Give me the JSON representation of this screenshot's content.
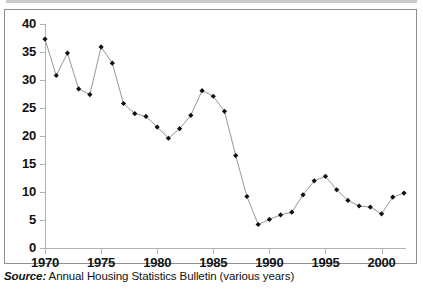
{
  "figure": {
    "caption_label": "Source:",
    "caption_text": "Annual Housing Statistics Bulletin (various years)",
    "frame_color": "#8e8e8e",
    "axis_color": "#b3b3b3",
    "marker_color": "#111111",
    "line_color": "#8a8a8a"
  },
  "chart_data": {
    "type": "line",
    "title": "",
    "subtitle": "",
    "xlabel": "",
    "ylabel": "",
    "xlim": [
      1970,
      2002
    ],
    "ylim": [
      0,
      40
    ],
    "grid": false,
    "legend": null,
    "y_ticks": [
      0,
      5,
      10,
      15,
      20,
      25,
      30,
      35,
      40
    ],
    "y_tick_labels": [
      "0",
      "5",
      "10",
      "15",
      "20",
      "25",
      "30",
      "35",
      "40"
    ],
    "x_ticks": [
      1970,
      1975,
      1980,
      1985,
      1990,
      1995,
      2000
    ],
    "x_tick_labels": [
      "1970",
      "1975",
      "1980",
      "1985",
      "1990",
      "1995",
      "2000"
    ],
    "x": [
      1970,
      1971,
      1972,
      1973,
      1974,
      1975,
      1976,
      1977,
      1978,
      1979,
      1980,
      1981,
      1982,
      1983,
      1984,
      1985,
      1986,
      1987,
      1988,
      1989,
      1990,
      1991,
      1992,
      1993,
      1994,
      1995,
      1996,
      1997,
      1998,
      1999,
      2000,
      2001,
      2002
    ],
    "series": [
      {
        "name": "",
        "values": [
          37.3,
          30.8,
          34.8,
          28.4,
          27.4,
          35.9,
          33.0,
          25.8,
          24.0,
          23.5,
          21.6,
          19.6,
          21.3,
          23.7,
          28.1,
          27.1,
          24.4,
          16.5,
          9.2,
          4.2,
          5.1,
          5.9,
          6.4,
          9.5,
          12.0,
          12.8,
          10.4,
          8.5,
          7.5,
          7.3,
          6.1,
          9.1,
          9.8
        ]
      }
    ],
    "marker": "diamond",
    "annotations": []
  }
}
